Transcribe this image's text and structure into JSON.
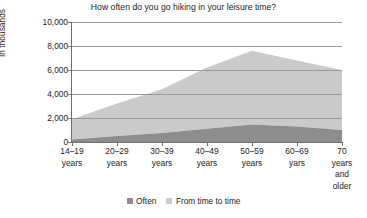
{
  "chart_data": {
    "type": "area",
    "stacked": true,
    "title": "How often do you go hiking in your leisure time?",
    "annotation": "n=25,363",
    "xlabel": "",
    "ylabel": "In thousands",
    "ylim": [
      0,
      10000
    ],
    "yticks": [
      0,
      2000,
      4000,
      6000,
      8000,
      10000
    ],
    "ytick_labels": [
      "0",
      "2,000",
      "4,000",
      "6,000",
      "8,000",
      "10,000"
    ],
    "grid": true,
    "legend_position": "bottom",
    "categories": [
      "14–19 years",
      "20–29 years",
      "30–39 years",
      "40–49 years",
      "50–59 years",
      "60–69 yars",
      "70 years and older"
    ],
    "category_lines": [
      [
        "14–19",
        "years"
      ],
      [
        "20–29",
        "years"
      ],
      [
        "30–39",
        "years"
      ],
      [
        "40–49",
        "years"
      ],
      [
        "50–59",
        "years"
      ],
      [
        "60–69",
        "yars"
      ],
      [
        "70",
        "years",
        "and",
        "older"
      ]
    ],
    "series": [
      {
        "name": "Often",
        "color": "#8d8d8d",
        "values": [
          200,
          500,
          750,
          1100,
          1450,
          1300,
          1000
        ]
      },
      {
        "name": "From time to time",
        "color": "#cacaca",
        "values": [
          1700,
          2700,
          3650,
          5100,
          6150,
          5500,
          5000
        ]
      }
    ],
    "stacked_totals": [
      1900,
      3200,
      4400,
      6200,
      7600,
      6800,
      6000
    ]
  },
  "legend": {
    "items": [
      {
        "label": "Often",
        "color": "#8d8d8d"
      },
      {
        "label": "From time to time",
        "color": "#cacaca"
      }
    ]
  },
  "colors": {
    "often": "#8d8d8d",
    "from_time_to_time": "#cacaca",
    "axis": "#6f6f6f",
    "grid": "#9a9a9a",
    "text": "#1c1c1c",
    "background": "#ffffff"
  }
}
